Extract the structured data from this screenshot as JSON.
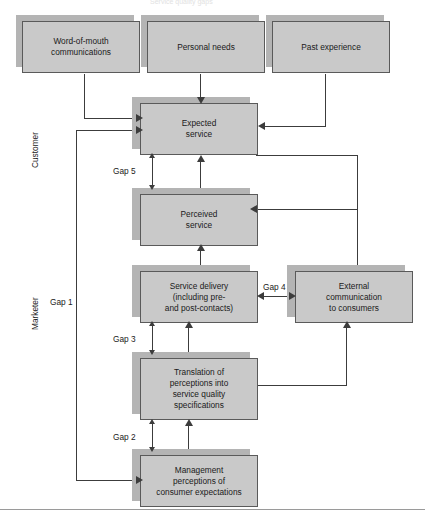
{
  "figure": {
    "top_caption": "Service quality gaps",
    "side_labels": [
      {
        "name": "customer",
        "text": "Customer"
      },
      {
        "name": "marketer",
        "text": "Marketer"
      }
    ]
  },
  "nodes": [
    {
      "id": "word-of-mouth",
      "lines": [
        "Word-of-mouth",
        "communications"
      ]
    },
    {
      "id": "personal-needs",
      "lines": [
        "Personal needs"
      ]
    },
    {
      "id": "past-experience",
      "lines": [
        "Past experience"
      ]
    },
    {
      "id": "expected-service",
      "lines": [
        "Expected",
        "service"
      ]
    },
    {
      "id": "perceived-service",
      "lines": [
        "Perceived",
        "service"
      ]
    },
    {
      "id": "service-delivery",
      "lines": [
        "Service delivery",
        "(including pre-",
        "and post-contacts)"
      ]
    },
    {
      "id": "external-communication",
      "lines": [
        "External",
        "communication",
        "to consumers"
      ]
    },
    {
      "id": "translation",
      "lines": [
        "Translation of",
        "perceptions into",
        "service quality",
        "specifications"
      ]
    },
    {
      "id": "management-perceptions",
      "lines": [
        "Management",
        "perceptions of",
        "consumer expectations"
      ]
    }
  ],
  "gaps": [
    {
      "id": "gap-1",
      "label": "Gap 1"
    },
    {
      "id": "gap-2",
      "label": "Gap 2"
    },
    {
      "id": "gap-3",
      "label": "Gap 3"
    },
    {
      "id": "gap-4",
      "label": "Gap 4"
    },
    {
      "id": "gap-5",
      "label": "Gap 5"
    }
  ],
  "colors": {
    "box_fill": "#c9c9c9",
    "box_border": "#5a5a5a",
    "box_shadow": "#b4b4b4",
    "connector": "#3c3c3c",
    "background": "#ffffff",
    "rule": "#9a9a9a"
  }
}
